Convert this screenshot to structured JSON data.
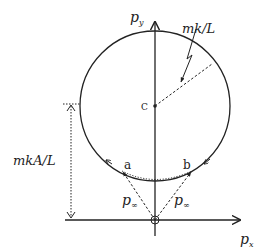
{
  "diagram": {
    "type": "momentum-space hodograph",
    "axes": {
      "x_label": "p",
      "x_sub": "x",
      "y_label": "p",
      "y_sub": "y"
    },
    "circle": {
      "center_label": "C",
      "radius_label": "mk/L"
    },
    "offset_label": "mkA/L",
    "points": [
      {
        "label": "a"
      },
      {
        "label": "b"
      }
    ],
    "vectors": [
      {
        "label": "p",
        "sub": "∞"
      },
      {
        "label": "p",
        "sub": "∞"
      }
    ],
    "colors": {
      "stroke": "#222222",
      "background": "#ffffff"
    }
  }
}
